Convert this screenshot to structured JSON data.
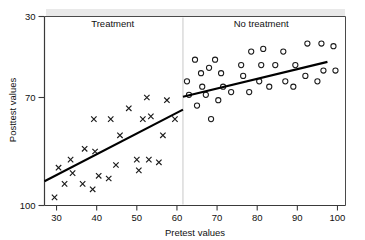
{
  "chart_data": {
    "type": "scatter",
    "title": "",
    "xlabel": "Pretest values",
    "ylabel": "Posttest values",
    "xlim": [
      27,
      102
    ],
    "ylim": [
      30,
      100
    ],
    "xticks": [
      30,
      40,
      50,
      60,
      70,
      80,
      90,
      100
    ],
    "yticks": [
      30,
      70,
      100
    ],
    "grid": false,
    "legend_position": "in-plot-top",
    "group_divider_x": 61.5,
    "annotations": [
      {
        "text": "Treatment",
        "x": 44,
        "y": 96
      },
      {
        "text": "No treatment",
        "x": 81,
        "y": 96
      }
    ],
    "series": [
      {
        "name": "Treatment",
        "marker": "x",
        "points": [
          [
            29.5,
            33
          ],
          [
            30.5,
            44
          ],
          [
            32.0,
            38
          ],
          [
            33.5,
            47
          ],
          [
            34.0,
            42
          ],
          [
            36.5,
            38
          ],
          [
            37.0,
            51
          ],
          [
            39.0,
            36
          ],
          [
            39.3,
            62
          ],
          [
            39.6,
            50
          ],
          [
            40.5,
            41
          ],
          [
            43.0,
            40
          ],
          [
            43.5,
            62
          ],
          [
            44.8,
            45
          ],
          [
            45.8,
            56
          ],
          [
            48.0,
            66
          ],
          [
            50.0,
            47
          ],
          [
            50.5,
            43
          ],
          [
            51.5,
            62
          ],
          [
            52.5,
            70
          ],
          [
            53.0,
            47
          ],
          [
            53.5,
            63
          ],
          [
            55.5,
            46
          ],
          [
            56.5,
            56
          ],
          [
            57.5,
            69
          ],
          [
            59.5,
            62
          ]
        ],
        "trend_line": {
          "x1": 27.0,
          "y1": 39.0,
          "x2": 61.5,
          "y2": 65.5
        }
      },
      {
        "name": "No treatment",
        "marker": "o",
        "points": [
          [
            62.5,
            76
          ],
          [
            63.0,
            71
          ],
          [
            64.5,
            84
          ],
          [
            65.0,
            67
          ],
          [
            66.0,
            79
          ],
          [
            66.3,
            74
          ],
          [
            67.2,
            71
          ],
          [
            68.0,
            81
          ],
          [
            68.5,
            62
          ],
          [
            69.5,
            84
          ],
          [
            70.3,
            69
          ],
          [
            71.0,
            79
          ],
          [
            71.5,
            74
          ],
          [
            73.5,
            72
          ],
          [
            76.0,
            82
          ],
          [
            76.5,
            78
          ],
          [
            78.0,
            72
          ],
          [
            78.5,
            87
          ],
          [
            80.5,
            76
          ],
          [
            81.0,
            82
          ],
          [
            81.5,
            88
          ],
          [
            83.0,
            74
          ],
          [
            84.5,
            82
          ],
          [
            86.5,
            87
          ],
          [
            87.0,
            76
          ],
          [
            89.0,
            74
          ],
          [
            89.5,
            82
          ],
          [
            92.0,
            78
          ],
          [
            92.5,
            90
          ],
          [
            95.0,
            76
          ],
          [
            96.0,
            90
          ],
          [
            96.5,
            80
          ],
          [
            99.0,
            89
          ],
          [
            99.5,
            80
          ]
        ],
        "trend_line": {
          "x1": 61.5,
          "y1": 70.3,
          "x2": 97.5,
          "y2": 83.2
        }
      }
    ]
  },
  "colors": {
    "marker": "#1a1a1a",
    "trend": "#000000",
    "frame": "#4a4a4a",
    "divider": "#c9c9c9",
    "background": "#ffffff",
    "top_band": "#e9e9e9"
  },
  "axes": {
    "x_title": "Pretest values",
    "y_title": "Posttest values",
    "x_tick_labels": [
      "30",
      "40",
      "50",
      "60",
      "70",
      "80",
      "90",
      "100"
    ],
    "y_tick_labels": [
      "100",
      "70",
      "30"
    ]
  },
  "groups": {
    "left_label": "Treatment",
    "right_label": "No treatment"
  }
}
